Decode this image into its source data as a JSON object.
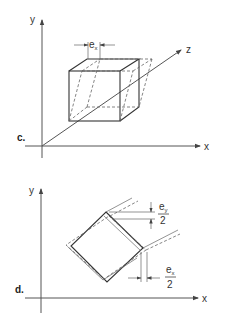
{
  "panel_c": {
    "label": "c.",
    "axes": {
      "x": "x",
      "y": "y",
      "z": "z"
    },
    "dimension": {
      "symbol": "e",
      "subscript": "x"
    },
    "description": "Cube with dashed sheared shape displaced by e_x in x-direction"
  },
  "panel_d": {
    "label": "d.",
    "axes": {
      "x": "x",
      "y": "y"
    },
    "dimension_y": {
      "symbol": "e",
      "subscript": "y",
      "denominator": "2"
    },
    "dimension_x": {
      "symbol": "e",
      "subscript": "x",
      "denominator": "2"
    },
    "description": "Rotated square (diamond) with dashed deformed outline showing e_x/2 and e_y/2 offsets"
  },
  "colors": {
    "line": "#333333",
    "dashed": "#666666",
    "background": "#ffffff"
  }
}
